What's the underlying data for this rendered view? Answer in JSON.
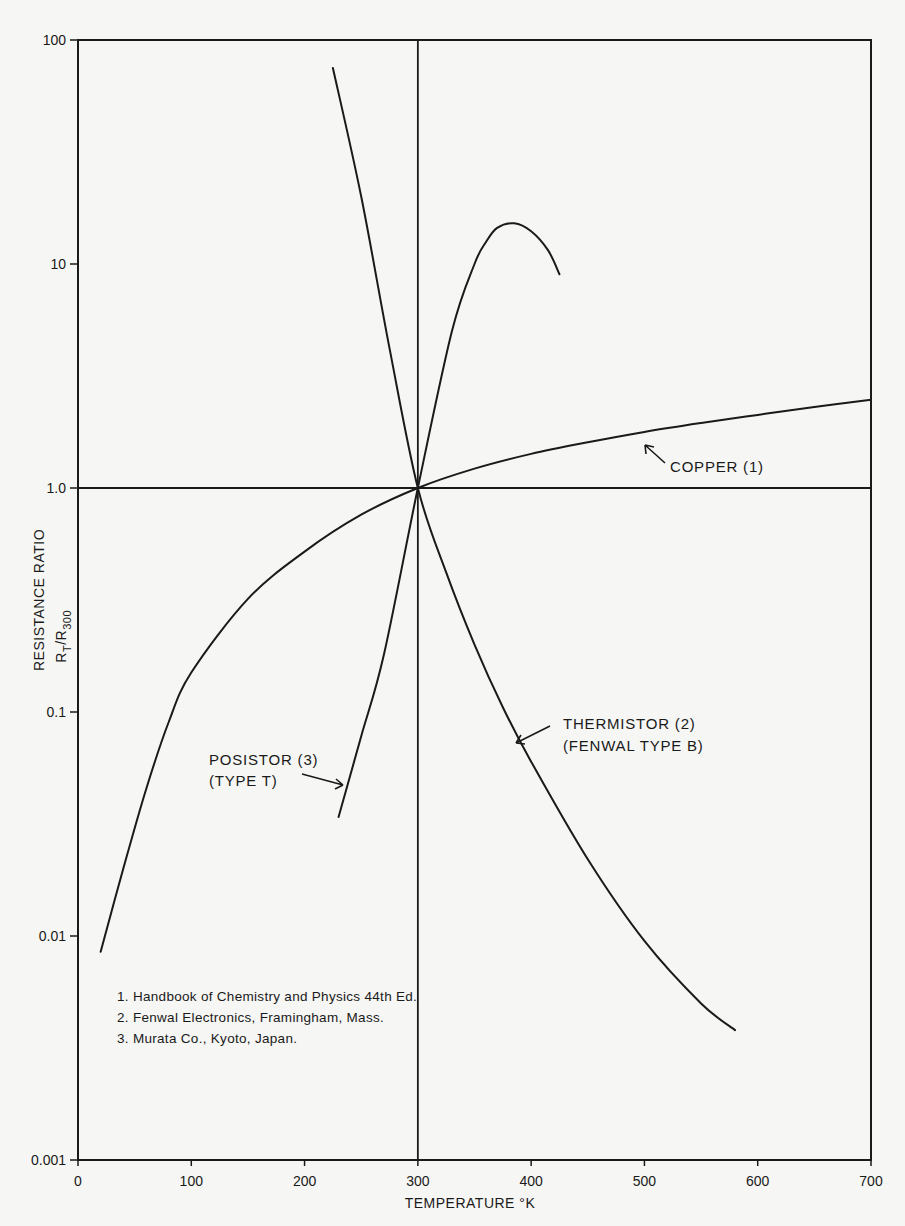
{
  "chart_data": {
    "type": "line",
    "title": "",
    "xlabel": "TEMPERATURE °K",
    "ylabel": "RESISTANCE RATIO",
    "ylabel_sub": "R_T / R_300",
    "xlim": [
      0,
      700
    ],
    "ylim": [
      0.001,
      100
    ],
    "yscale": "log",
    "grid": false,
    "x_ticks": [
      "0",
      "100",
      "200",
      "300",
      "400",
      "500",
      "600",
      "700"
    ],
    "y_ticks": [
      "0.001",
      "0.01",
      "0.1",
      "1.0",
      "10",
      "100"
    ],
    "reference_lines": {
      "vertical_x": 300,
      "horizontal_y": 1.0
    },
    "series": [
      {
        "name": "COPPER (1)",
        "x": [
          20,
          40,
          60,
          80,
          100,
          150,
          200,
          250,
          300,
          350,
          400,
          450,
          500,
          550,
          600,
          650,
          700
        ],
        "y": [
          0.0085,
          0.02,
          0.045,
          0.09,
          0.15,
          0.32,
          0.52,
          0.76,
          1.0,
          1.22,
          1.42,
          1.6,
          1.78,
          1.95,
          2.12,
          2.3,
          2.48
        ]
      },
      {
        "name": "THERMISTOR (2) (FENWAL TYPE B)",
        "x": [
          225,
          250,
          275,
          300,
          325,
          350,
          375,
          400,
          450,
          500,
          550,
          580
        ],
        "y": [
          75,
          20,
          4.2,
          1.0,
          0.42,
          0.2,
          0.105,
          0.06,
          0.022,
          0.0095,
          0.005,
          0.0038
        ]
      },
      {
        "name": "POSISTOR (3) (TYPE T)",
        "x": [
          230,
          250,
          270,
          300,
          330,
          350,
          360,
          370,
          385,
          400,
          415,
          425
        ],
        "y": [
          0.034,
          0.078,
          0.18,
          1.0,
          5.0,
          10,
          12.5,
          14.5,
          15.2,
          14.0,
          11.5,
          9.0
        ]
      }
    ],
    "annotations": [
      {
        "text": "COPPER (1)",
        "x": 470,
        "y": 1.65
      },
      {
        "text": "THERMISTOR (2)",
        "line2": "(FENWAL TYPE B)",
        "x": 390,
        "y": 0.1
      },
      {
        "text": "POSISTOR (3)",
        "line2": "(TYPE T)",
        "x": 230,
        "y": 0.05
      }
    ],
    "notes": [
      "1.  Handbook of Chemistry and Physics 44th Ed.",
      "2.  Fenwal Electronics, Framingham, Mass.",
      "3.  Murata Co., Kyoto, Japan."
    ]
  },
  "labels": {
    "xlabel": "TEMPERATURE °K",
    "ylabel": "RESISTANCE RATIO",
    "ylabel_R": "R",
    "ylabel_T": "T",
    "ylabel_slash": "/R",
    "ylabel_300": "300",
    "copper": "COPPER (1)",
    "thermistor_1": "THERMISTOR (2)",
    "thermistor_2": "(FENWAL TYPE B)",
    "posistor_1": "POSISTOR (3)",
    "posistor_2": "(TYPE T)"
  }
}
